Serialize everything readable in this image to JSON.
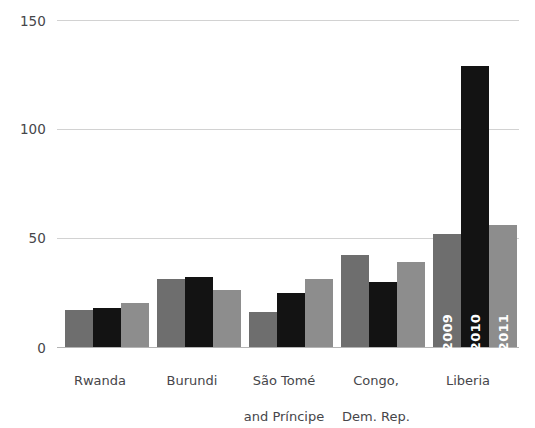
{
  "chart_data": {
    "type": "bar",
    "title": "",
    "subtitle": "",
    "xlabel": "",
    "ylabel": "",
    "ylim": [
      0,
      150
    ],
    "yticks": [
      0,
      50,
      100,
      150
    ],
    "ytick_labels": [
      "0",
      "50",
      "100",
      "150"
    ],
    "grid": true,
    "grid_axis": "y",
    "legend_position": "in-bars-liberia",
    "categories": [
      "Rwanda",
      "Burundi",
      "São Tomé\nand Príncipe",
      "Congo,\nDem. Rep.",
      "Liberia"
    ],
    "category_labels": [
      {
        "line1": "Rwanda",
        "line2": ""
      },
      {
        "line1": "Burundi",
        "line2": ""
      },
      {
        "line1": "São Tomé",
        "line2": "and Príncipe"
      },
      {
        "line1": "Congo,",
        "line2": "Dem. Rep."
      },
      {
        "line1": "Liberia",
        "line2": ""
      }
    ],
    "series": [
      {
        "name": "2009",
        "color": "#6e6e6e",
        "values": [
          17,
          31,
          16,
          42,
          52
        ]
      },
      {
        "name": "2010",
        "color": "#131313",
        "values": [
          18,
          32,
          25,
          30,
          129
        ]
      },
      {
        "name": "2011",
        "color": "#8d8d8d",
        "values": [
          20,
          26,
          31,
          39,
          56
        ]
      }
    ],
    "series_labels_shown_on": "Liberia",
    "annotations": [
      {
        "text": "2009",
        "location": "inside-liberia-bar-1",
        "orientation": "vertical",
        "color": "#ffffff"
      },
      {
        "text": "2010",
        "location": "inside-liberia-bar-2",
        "orientation": "vertical",
        "color": "#ffffff"
      },
      {
        "text": "2011",
        "location": "inside-liberia-bar-3",
        "orientation": "vertical",
        "color": "#ffffff"
      }
    ],
    "colors": {
      "series_2009": "#6e6e6e",
      "series_2010": "#131313",
      "series_2011": "#8d8d8d",
      "gridline": "#d2d2d2",
      "axis": "#b4b4b4",
      "text": "#46464a",
      "background": "#ffffff"
    }
  }
}
